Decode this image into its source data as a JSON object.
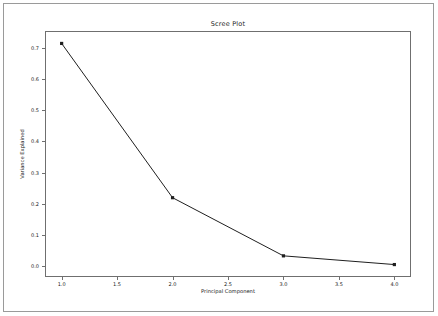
{
  "chart_data": {
    "type": "line",
    "title": "Scree Plot",
    "xlabel": "Principal Component",
    "ylabel": "Variance Explained",
    "x": [
      1.0,
      2.0,
      3.0,
      4.0
    ],
    "values": [
      0.715,
      0.219,
      0.032,
      0.004
    ],
    "series": [
      {
        "name": "Variance Explained",
        "x": [
          1.0,
          2.0,
          3.0,
          4.0
        ],
        "values": [
          0.715,
          0.219,
          0.032,
          0.004
        ]
      }
    ],
    "xlim": [
      0.85,
      4.15
    ],
    "ylim": [
      -0.036,
      0.755
    ],
    "xticks": [
      1.0,
      1.5,
      2.0,
      2.5,
      3.0,
      3.5,
      4.0
    ],
    "xtick_labels": [
      "1.0",
      "1.5",
      "2.0",
      "2.5",
      "3.0",
      "3.5",
      "4.0"
    ],
    "yticks": [
      0.0,
      0.1,
      0.2,
      0.3,
      0.4,
      0.5,
      0.6,
      0.7
    ],
    "ytick_labels": [
      "0.0",
      "0.1",
      "0.2",
      "0.3",
      "0.4",
      "0.5",
      "0.6",
      "0.7"
    ],
    "grid": false,
    "legend": null,
    "line_color": "#1f1f1f",
    "marker": "square",
    "marker_color": "#1f1f1f",
    "background": "#ffffff",
    "frame_color": "#6f6f6f"
  }
}
